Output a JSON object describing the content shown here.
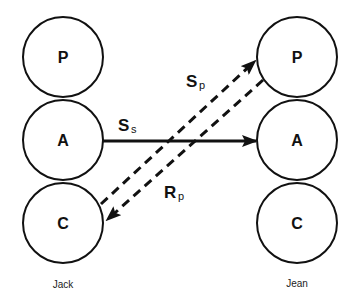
{
  "diagram": {
    "type": "transactional-analysis",
    "people": [
      {
        "name": "Jack",
        "ego_states": [
          {
            "label": "P"
          },
          {
            "label": "A"
          },
          {
            "label": "C"
          }
        ]
      },
      {
        "name": "Jean",
        "ego_states": [
          {
            "label": "P"
          },
          {
            "label": "A"
          },
          {
            "label": "C"
          }
        ]
      }
    ],
    "transactions": [
      {
        "main": "S",
        "sub": "s",
        "from": "Jack.A",
        "to": "Jean.A",
        "style": "solid"
      },
      {
        "main": "S",
        "sub": "p",
        "from": "Jack.C",
        "to": "Jean.P",
        "style": "dashed"
      },
      {
        "main": "R",
        "sub": "p",
        "from": "Jean.P",
        "to": "Jack.C",
        "style": "dashed"
      }
    ]
  },
  "colors": {
    "stroke": "#111111",
    "background": "#ffffff"
  }
}
